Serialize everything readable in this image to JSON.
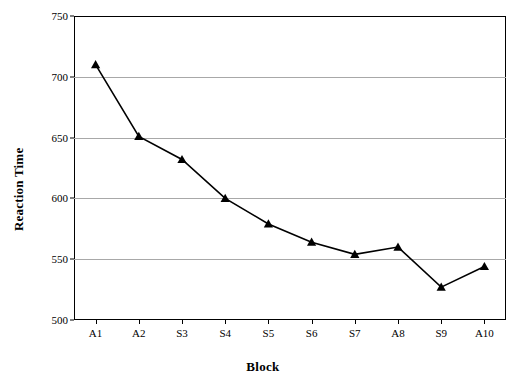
{
  "chart_data": {
    "type": "line",
    "title": "",
    "xlabel": "Block",
    "ylabel": "Reaction Time",
    "categories": [
      "A1",
      "A2",
      "S3",
      "S4",
      "S5",
      "S6",
      "S7",
      "A8",
      "S9",
      "A10"
    ],
    "values": [
      710,
      651,
      632,
      600,
      579,
      564,
      554,
      560,
      527,
      544
    ],
    "series": [
      {
        "name": "Reaction Time",
        "values": [
          710,
          651,
          632,
          600,
          579,
          564,
          554,
          560,
          527,
          544
        ]
      }
    ],
    "ylim": [
      500,
      750
    ],
    "yticks": [
      500,
      550,
      600,
      650,
      700,
      750
    ],
    "ytick_labels": [
      "500",
      "550",
      "600",
      "650",
      "700",
      "750"
    ],
    "grid": true,
    "legend": false,
    "marker": "triangle",
    "line_color": "#000000",
    "marker_color": "#000000",
    "grid_color": "#9a9a9a",
    "axis_color": "#000000",
    "background": "#ffffff"
  }
}
